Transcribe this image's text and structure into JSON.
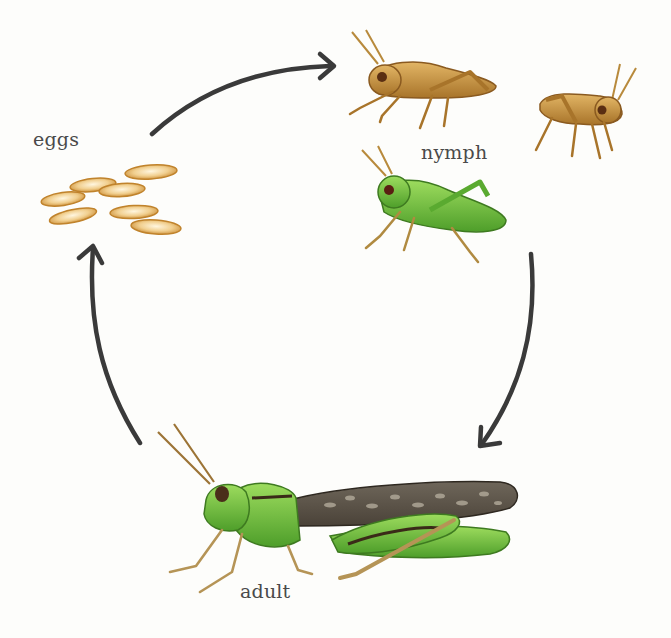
{
  "diagram": {
    "type": "life-cycle",
    "stages": [
      {
        "id": "eggs",
        "label": "eggs"
      },
      {
        "id": "nymph",
        "label": "nymph"
      },
      {
        "id": "adult",
        "label": "adult"
      }
    ],
    "arrows": [
      {
        "from": "eggs",
        "to": "nymph"
      },
      {
        "from": "nymph",
        "to": "adult"
      },
      {
        "from": "adult",
        "to": "eggs"
      }
    ]
  },
  "colors": {
    "background": "#fdfdfb",
    "arrow": "#3a3a3a",
    "label": "#4a4a4a",
    "egg": "#e8b86a",
    "nymph_brown": "#c8943e",
    "nymph_green": "#6cbf3a",
    "adult_green": "#7cc544",
    "adult_wing": "#5b5247"
  }
}
